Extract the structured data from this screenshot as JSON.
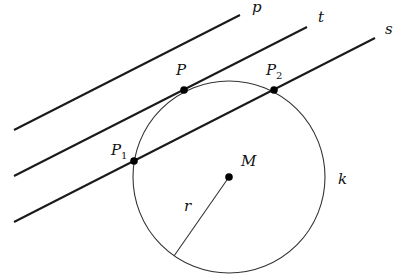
{
  "diagram": {
    "lines": [
      {
        "name": "p",
        "x1": 14,
        "y1": 130,
        "x2": 240,
        "y2": 15,
        "label": "p",
        "lx": 252,
        "ly": 12
      },
      {
        "name": "t",
        "x1": 14,
        "y1": 176,
        "x2": 307,
        "y2": 27,
        "label": "t",
        "lx": 318,
        "ly": 22
      },
      {
        "name": "s",
        "x1": 14,
        "y1": 222,
        "x2": 375,
        "y2": 38,
        "label": "s",
        "lx": 385,
        "ly": 34
      }
    ],
    "circle": {
      "name": "k",
      "cx": 229,
      "cy": 177,
      "r": 96,
      "label": "k",
      "lx": 338,
      "ly": 184
    },
    "center": {
      "name": "M",
      "x": 229,
      "y": 177,
      "label": "M",
      "lx": 241,
      "ly": 166
    },
    "radius": {
      "name": "r",
      "x1": 229,
      "y1": 177,
      "x2": 174,
      "y2": 256,
      "label": "r",
      "lx": 184,
      "ly": 211
    },
    "points": [
      {
        "name": "P",
        "x": 184,
        "y": 90,
        "label": "P",
        "sub": "",
        "lx": 176,
        "ly": 75
      },
      {
        "name": "P2",
        "x": 274,
        "y": 90,
        "label": "P",
        "sub": "2",
        "lx": 266,
        "ly": 75
      },
      {
        "name": "P1",
        "x": 134,
        "y": 161,
        "label": "P",
        "sub": "1",
        "lx": 111,
        "ly": 155
      }
    ],
    "colors": {
      "line": "#1a1a1a",
      "circle": "#333333",
      "point": "#000000"
    }
  }
}
